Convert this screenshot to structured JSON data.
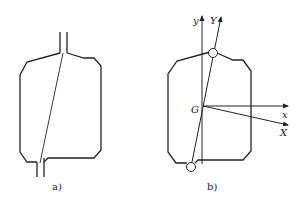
{
  "figure": {
    "panels": [
      {
        "id": "a",
        "caption": "a)",
        "description": "Vessel outline with inlet pipe on top, outlet pipe at bottom, and a diagonal line connecting them"
      },
      {
        "id": "b",
        "caption": "b)",
        "description": "Vessel outline with connection points shown as circles; local and rotated coordinate axes at centre G",
        "labels": {
          "origin": "G",
          "axis_y": "y",
          "axis_Y": "Y",
          "axis_x": "x",
          "axis_X": "X"
        }
      }
    ]
  },
  "colors": {
    "stroke": "#222222",
    "background": "#ffffff"
  }
}
